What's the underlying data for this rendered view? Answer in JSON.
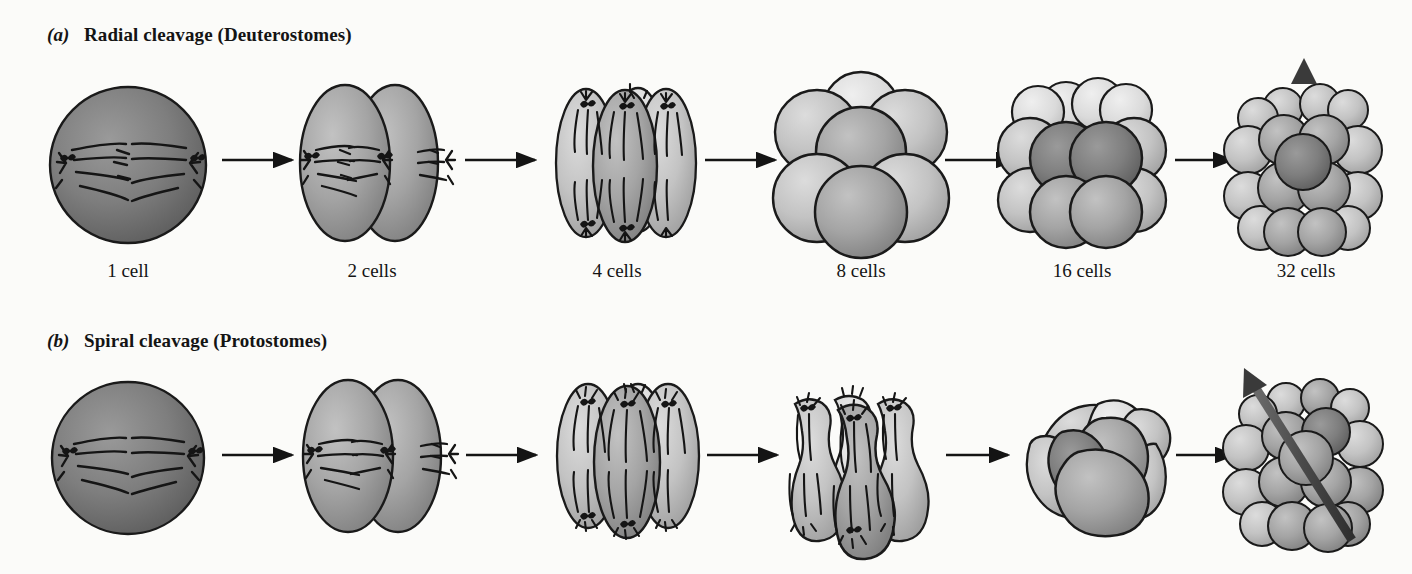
{
  "figure": {
    "title_visible": false,
    "background_color": "#fbfbf9",
    "ink_color": "#141414",
    "rows": [
      {
        "tag": "(a)",
        "tag_letter": "a",
        "heading": "Radial cleavage (Deuterostomes)",
        "clade": "Deuterostomes",
        "cleavage_type": "Radial",
        "axis_arrow": "vertical",
        "stages": [
          {
            "label": "1 cell",
            "cell_count": 1,
            "shape": "sphere",
            "features": "mitotic spindle with two centrosomes and astral rays, chromosomes at metaphase plate"
          },
          {
            "label": "2 cells",
            "cell_count": 2,
            "shape": "two-ellipsoids",
            "features": "two blastomeres side by side, each with a horizontal spindle"
          },
          {
            "label": "4 cells",
            "cell_count": 4,
            "shape": "four-ovoids",
            "features": "four elongated blastomeres in a row with vertical spindles"
          },
          {
            "label": "8 cells",
            "cell_count": 8,
            "shape": "two-tiers",
            "features": "upper tier of four cells sitting directly on top of lower tier of four"
          },
          {
            "label": "16 cells",
            "cell_count": 16,
            "shape": "stacked-tiers",
            "features": "tiers aligned one above the other, cells stacked directly"
          },
          {
            "label": "32 cells",
            "cell_count": 32,
            "shape": "blastula",
            "features": "blastula with straight vertical animal-vegetal axis arrow"
          }
        ]
      },
      {
        "tag": "(b)",
        "tag_letter": "b",
        "heading": "Spiral cleavage (Protostomes)",
        "clade": "Protostomes",
        "cleavage_type": "Spiral",
        "axis_arrow": "oblique",
        "stages": [
          {
            "label": "",
            "cell_count": 1,
            "shape": "sphere",
            "features": "mitotic spindle with two centrosomes and astral rays"
          },
          {
            "label": "",
            "cell_count": 2,
            "shape": "two-ellipsoids",
            "features": "two blastomeres with horizontal spindles"
          },
          {
            "label": "",
            "cell_count": 4,
            "shape": "four-ovoids",
            "features": "four elongated blastomeres with spindles"
          },
          {
            "label": "",
            "cell_count": 8,
            "shape": "flask-lobes",
            "features": "pear-shaped blastomeres dividing with oblique, tilted spindles"
          },
          {
            "label": "",
            "cell_count": 16,
            "shape": "offset-tiers",
            "features": "upper tier cells offset, sitting in the grooves between lower cells"
          },
          {
            "label": "",
            "cell_count": 32,
            "shape": "blastula",
            "features": "blastula with oblique, diagonally tilted axis arrow"
          }
        ]
      }
    ],
    "connector_count_per_row": 5,
    "connector_icon": "right-arrow"
  }
}
